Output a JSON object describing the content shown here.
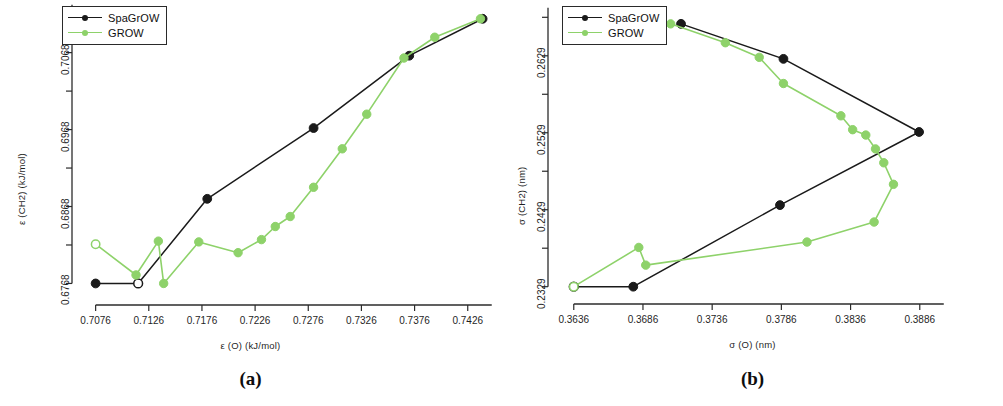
{
  "figure": {
    "panels": [
      {
        "caption": "(a)",
        "legend": {
          "entries": [
            {
              "label": "SpaGrOW",
              "color": "#1a1a1a"
            },
            {
              "label": "GROW",
              "color": "#8ed26a"
            }
          ]
        },
        "chart_data": {
          "type": "line",
          "title": "",
          "xlabel": "ε (O) (kJ/mol)",
          "ylabel": "ε (CH2) (kJ/mol)",
          "xlim": [
            0.7066,
            0.7446
          ],
          "ylim": [
            0.6753,
            0.7113
          ],
          "xticks": [
            0.7076,
            0.7126,
            0.7176,
            0.7226,
            0.7276,
            0.7326,
            0.7376,
            0.7426
          ],
          "xtick_labels": [
            "0.7076",
            "0.7126",
            "0.7176",
            "0.7226",
            "0.7276",
            "0.7326",
            "0.7376",
            "0.7426"
          ],
          "yticks": [
            0.6768,
            0.6868,
            0.6968,
            0.7068
          ],
          "ytick_labels": [
            "0.6768",
            "0.6868",
            "0.6968",
            "0.7068"
          ],
          "grid": false,
          "legend_position": "top-left",
          "series": [
            {
              "name": "SpaGrOW",
              "color": "#1a1a1a",
              "marker": "filled-circle",
              "open_marker_indices": [
                1
              ],
              "points": [
                {
                  "x": 0.7076,
                  "y": 0.6768
                },
                {
                  "x": 0.7116,
                  "y": 0.6768
                },
                {
                  "x": 0.7181,
                  "y": 0.6878
                },
                {
                  "x": 0.7281,
                  "y": 0.697
                },
                {
                  "x": 0.7371,
                  "y": 0.7064
                },
                {
                  "x": 0.744,
                  "y": 0.7112
                }
              ]
            },
            {
              "name": "GROW",
              "color": "#8ed26a",
              "marker": "filled-circle",
              "open_marker_indices": [
                0
              ],
              "points": [
                {
                  "x": 0.7076,
                  "y": 0.6819
                },
                {
                  "x": 0.7114,
                  "y": 0.6779
                },
                {
                  "x": 0.7135,
                  "y": 0.6823
                },
                {
                  "x": 0.714,
                  "y": 0.6768
                },
                {
                  "x": 0.7173,
                  "y": 0.6822
                },
                {
                  "x": 0.721,
                  "y": 0.6808
                },
                {
                  "x": 0.7232,
                  "y": 0.6825
                },
                {
                  "x": 0.7245,
                  "y": 0.6842
                },
                {
                  "x": 0.7259,
                  "y": 0.6855
                },
                {
                  "x": 0.7281,
                  "y": 0.6893
                },
                {
                  "x": 0.7308,
                  "y": 0.6943
                },
                {
                  "x": 0.7331,
                  "y": 0.6988
                },
                {
                  "x": 0.7366,
                  "y": 0.7061
                },
                {
                  "x": 0.7395,
                  "y": 0.7088
                },
                {
                  "x": 0.7438,
                  "y": 0.7112
                }
              ]
            }
          ]
        }
      },
      {
        "caption": "(b)",
        "legend": {
          "entries": [
            {
              "label": "SpaGrOW",
              "color": "#1a1a1a"
            },
            {
              "label": "GROW",
              "color": "#8ed26a"
            }
          ]
        },
        "chart_data": {
          "type": "line",
          "title": "",
          "xlabel": "σ (O) (nm)",
          "ylabel": "σ (CH2) (nm)",
          "xlim": [
            0.36275,
            0.38905
          ],
          "ylim": [
            0.23195,
            0.26755
          ],
          "xticks": [
            0.3636,
            0.3686,
            0.3736,
            0.3786,
            0.3836,
            0.3886
          ],
          "xtick_labels": [
            "0.3636",
            "0.3686",
            "0.3736",
            "0.3786",
            "0.3836",
            "0.3886"
          ],
          "yticks": [
            0.2329,
            0.2429,
            0.2529,
            0.2629
          ],
          "ytick_labels": [
            "0.2329",
            "0.2429",
            "0.2529",
            "0.2629"
          ],
          "grid": false,
          "legend_position": "top-left",
          "series": [
            {
              "name": "SpaGrOW",
              "color": "#1a1a1a",
              "marker": "filled-circle",
              "open_marker_indices": [
                0
              ],
              "points": [
                {
                  "x": 0.3636,
                  "y": 0.2329
                },
                {
                  "x": 0.3679,
                  "y": 0.2329
                },
                {
                  "x": 0.3785,
                  "y": 0.2435
                },
                {
                  "x": 0.38855,
                  "y": 0.253
                },
                {
                  "x": 0.37875,
                  "y": 0.2625
                },
                {
                  "x": 0.37135,
                  "y": 0.26705
                }
              ]
            },
            {
              "name": "GROW",
              "color": "#8ed26a",
              "marker": "filled-circle",
              "open_marker_indices": [
                0
              ],
              "points": [
                {
                  "x": 0.3636,
                  "y": 0.2329
                },
                {
                  "x": 0.3683,
                  "y": 0.238
                },
                {
                  "x": 0.3688,
                  "y": 0.2357
                },
                {
                  "x": 0.38045,
                  "y": 0.2387
                },
                {
                  "x": 0.3853,
                  "y": 0.2413
                },
                {
                  "x": 0.3867,
                  "y": 0.2462
                },
                {
                  "x": 0.386,
                  "y": 0.249
                },
                {
                  "x": 0.3854,
                  "y": 0.2508
                },
                {
                  "x": 0.3847,
                  "y": 0.2526
                },
                {
                  "x": 0.38375,
                  "y": 0.2533
                },
                {
                  "x": 0.3829,
                  "y": 0.2551
                },
                {
                  "x": 0.37875,
                  "y": 0.2593
                },
                {
                  "x": 0.377,
                  "y": 0.2627
                },
                {
                  "x": 0.37455,
                  "y": 0.2646
                },
                {
                  "x": 0.3706,
                  "y": 0.26705
                }
              ]
            }
          ]
        }
      }
    ]
  }
}
